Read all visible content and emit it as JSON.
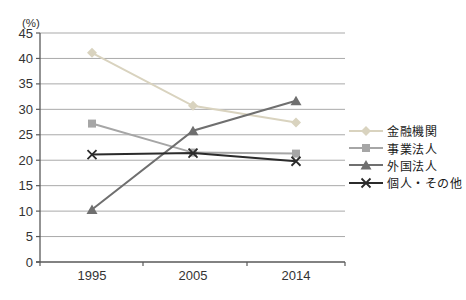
{
  "chart_data": {
    "type": "line",
    "title": "",
    "y_unit_label": "(%)",
    "categories": [
      "1995",
      "2005",
      "2014"
    ],
    "ylim": [
      0,
      45
    ],
    "ytick_step": 5,
    "grid": "horizontal",
    "legend_position": "right",
    "series": [
      {
        "key": "financial-institutions",
        "name": "金融機関",
        "color": "#d9d3bf",
        "marker": "diamond",
        "values": [
          41.1,
          30.7,
          27.4
        ]
      },
      {
        "key": "business-corporations",
        "name": "事業法人",
        "color": "#a6a6a6",
        "marker": "square",
        "values": [
          27.2,
          21.5,
          21.3
        ]
      },
      {
        "key": "foreign-corporations",
        "name": "外国法人",
        "color": "#6f6f6f",
        "marker": "triangle",
        "values": [
          10.3,
          25.8,
          31.7
        ]
      },
      {
        "key": "individuals-others",
        "name": "個人・その他",
        "color": "#2b2b2b",
        "marker": "x",
        "values": [
          21.1,
          21.4,
          19.8
        ]
      }
    ],
    "colors": {
      "gridline": "#a9a9a9",
      "axis": "#595959",
      "tick_text": "#333333"
    }
  }
}
